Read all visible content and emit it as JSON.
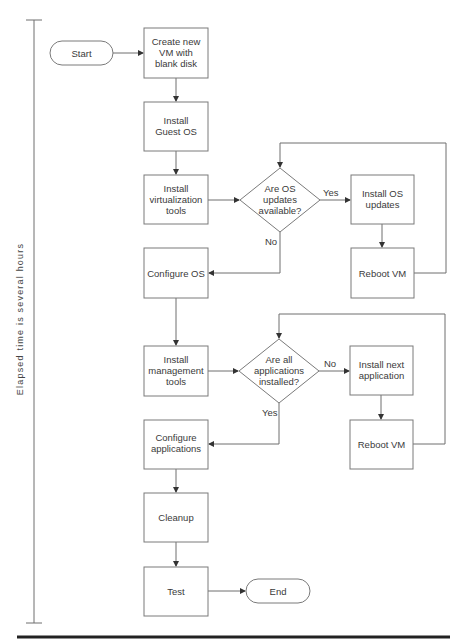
{
  "timeline": {
    "label": "Elapsed time is several hours"
  },
  "nodes": {
    "start": "Start",
    "create_vm": [
      "Create new",
      "VM with",
      "blank disk"
    ],
    "install_guest_os": [
      "Install",
      "Guest OS"
    ],
    "install_virt_tools": [
      "Install",
      "virtualization",
      "tools"
    ],
    "os_updates_decision": [
      "Are OS",
      "updates",
      "available?"
    ],
    "install_os_updates": [
      "Install OS",
      "updates"
    ],
    "reboot_vm_1": "Reboot VM",
    "configure_os": "Configure OS",
    "install_mgmt_tools": [
      "Install",
      "management",
      "tools"
    ],
    "apps_decision": [
      "Are all",
      "applications",
      "installed?"
    ],
    "install_next_app": [
      "Install next",
      "application"
    ],
    "reboot_vm_2": "Reboot VM",
    "configure_apps": [
      "Configure",
      "applications"
    ],
    "cleanup": "Cleanup",
    "test": "Test",
    "end": "End"
  },
  "edge_labels": {
    "os_yes": "Yes",
    "os_no": "No",
    "apps_no": "No",
    "apps_yes": "Yes"
  },
  "colors": {
    "stroke": "#7a7a7a",
    "text": "#3a3a3a",
    "rule": "#222222"
  }
}
